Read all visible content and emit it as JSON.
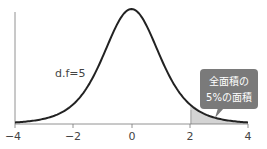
{
  "chart_data": {
    "type": "line",
    "title": "",
    "xlabel": "",
    "ylabel": "",
    "xlim": [
      -4,
      4
    ],
    "xticks": [
      -4,
      -2,
      0,
      2,
      4
    ],
    "xtick_labels": [
      "−4",
      "−2",
      "0",
      "2",
      "4"
    ],
    "grid": false,
    "series": [
      {
        "name": "t distribution",
        "df": 5,
        "label": "d.f=5"
      }
    ],
    "shaded_region": {
      "from": 2.015,
      "to": 4,
      "meaning": "upper 5% tail"
    },
    "annotations": [
      {
        "text": "d.f=5",
        "x": -1.6,
        "y": 0.13
      },
      {
        "text_line1": "全面積の",
        "text_line2": "5%の面積",
        "points_to": "shaded right tail"
      }
    ]
  },
  "labels": {
    "df": "d.f=5",
    "callout_line1": "全面積の",
    "callout_line2": "5%の面積",
    "ticks": [
      "−4",
      "−2",
      "0",
      "2",
      "4"
    ]
  },
  "colors": {
    "curve": "#222222",
    "axis": "#555555",
    "shade": "#d4d4d4",
    "callout": "#7a7a7a",
    "callout_text": "#ffffff"
  }
}
